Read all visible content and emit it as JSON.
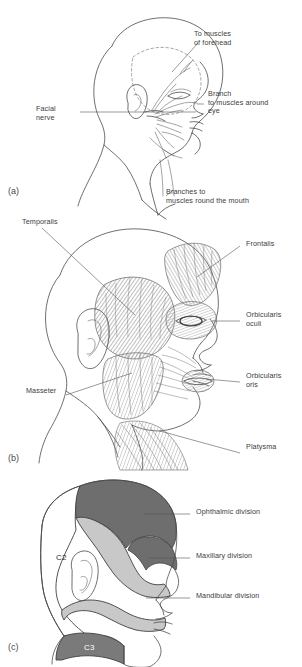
{
  "figure": {
    "type": "anatomical-illustration",
    "panels": [
      {
        "letter": "(a)",
        "name": "facial-nerve-distribution",
        "subject": "lateral view of head showing the facial nerve and its branches",
        "labels": [
          {
            "id": "to-muscles-of-forehead",
            "text": "To muscles\nof forehead"
          },
          {
            "id": "branch-to-muscles-around-eye",
            "text": "Branch\nto muscles around\neye"
          },
          {
            "id": "facial-nerve",
            "text": "Facial\nnerve"
          },
          {
            "id": "branches-to-muscles-round-the-mouth",
            "text": "Branches to\nmuscles round the mouth"
          }
        ]
      },
      {
        "letter": "(b)",
        "name": "facial-muscles",
        "subject": "lateral view of head showing muscles of the face and scalp",
        "labels": [
          {
            "id": "temporalis",
            "text": "Temporalis"
          },
          {
            "id": "frontalis",
            "text": "Frontalis"
          },
          {
            "id": "orbicularis-oculi",
            "text": "Orbicularis\noculi"
          },
          {
            "id": "orbicularis-oris",
            "text": "Orbicularis\noris"
          },
          {
            "id": "masseter",
            "text": "Masseter"
          },
          {
            "id": "platysma",
            "text": "Platysma"
          }
        ]
      },
      {
        "letter": "(c)",
        "name": "trigeminal-dermatomes",
        "subject": "lateral view of head showing sensory territories of the trigeminal nerve divisions and cervical dermatomes",
        "labels": [
          {
            "id": "ophthalmic-division",
            "text": "Ophthalmic division"
          },
          {
            "id": "maxillary-division",
            "text": "Maxillary division"
          },
          {
            "id": "mandibular-division",
            "text": "Mandibular division"
          }
        ],
        "region_labels": [
          {
            "id": "c2",
            "text": "C2"
          },
          {
            "id": "c3",
            "text": "C3"
          }
        ],
        "region_colors": {
          "ophthalmic": "#6e6e6e",
          "maxillary": "#c8c8c8",
          "mandibular": "#c8c8c8",
          "c2": "#ffffff",
          "c3": "#7a7a7a"
        }
      }
    ],
    "colors": {
      "background": "#ffffff",
      "ink": "#4a4a4a",
      "text": "#3c3c3c",
      "muscle_shade": "#9a9a9a",
      "temporalis_shade": "#8d8d8d"
    }
  }
}
